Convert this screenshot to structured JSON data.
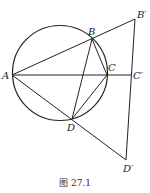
{
  "figure": {
    "caption": "图 27.1",
    "points": {
      "A": {
        "label": "A",
        "x": 12,
        "y": 75
      },
      "B": {
        "label": "B",
        "x": 92,
        "y": 39
      },
      "C": {
        "label": "C",
        "x": 107,
        "y": 75
      },
      "D": {
        "label": "D",
        "x": 72,
        "y": 119
      },
      "B_prime": {
        "label": "B′",
        "x": 135,
        "y": 19
      },
      "C_prime": {
        "label": "C′",
        "x": 131,
        "y": 75
      },
      "D_prime": {
        "label": "D′",
        "x": 126,
        "y": 160
      }
    },
    "circle": {
      "cx": 60,
      "cy": 73,
      "r": 47.5
    },
    "segments": [
      [
        "A",
        "B_prime"
      ],
      [
        "A",
        "C_prime"
      ],
      [
        "A",
        "D_prime"
      ],
      [
        "B_prime",
        "D_prime"
      ],
      [
        "B",
        "C"
      ],
      [
        "B",
        "D"
      ],
      [
        "C",
        "D"
      ]
    ],
    "stroke_color": "#222222"
  }
}
